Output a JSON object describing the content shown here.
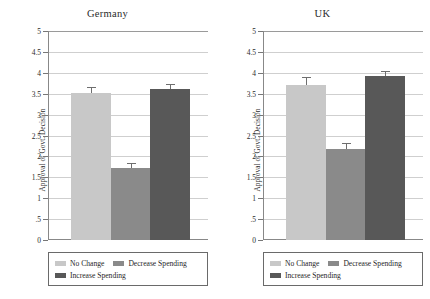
{
  "chart_data": {
    "type": "bar",
    "title": "",
    "xlabel": "",
    "ylabel": "Approval of Govt. Decision",
    "ylim": [
      0,
      5
    ],
    "ytick_labels": [
      "5",
      "4.5",
      "4",
      "3.5",
      "3",
      "2.5",
      "2",
      "1.5",
      "1",
      ".5",
      "0"
    ],
    "ytick_values": [
      5,
      4.5,
      4,
      3.5,
      3,
      2.5,
      2,
      1.5,
      1,
      0.5,
      0
    ],
    "grid": "horizontal",
    "legend_position": "below-panel",
    "categories": [
      "No Change",
      "Decrease Spending",
      "Increase Spending"
    ],
    "colors": [
      "#c8c8c8",
      "#8a8a8a",
      "#585858"
    ],
    "panels": [
      {
        "title": "Germany",
        "values": [
          3.52,
          1.73,
          3.62
        ],
        "errors": [
          0.14,
          0.11,
          0.12
        ]
      },
      {
        "title": "UK",
        "values": [
          3.7,
          2.18,
          3.93
        ],
        "errors": [
          0.19,
          0.15,
          0.11
        ]
      }
    ]
  },
  "legend": {
    "items": [
      {
        "label": "No Change",
        "color": "#c8c8c8"
      },
      {
        "label": "Decrease Spending",
        "color": "#8a8a8a"
      },
      {
        "label": "Increase Spending",
        "color": "#585858"
      }
    ]
  }
}
